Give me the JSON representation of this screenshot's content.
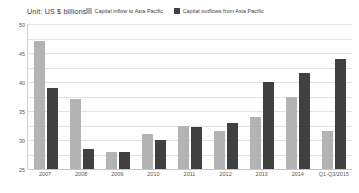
{
  "chart_data": {
    "type": "bar",
    "title": "Unit: US $ billions",
    "xlabel": "",
    "ylabel": "",
    "ylim": [
      0,
      50
    ],
    "yticks": [
      50,
      45,
      40,
      35,
      30,
      25,
      20,
      15,
      10,
      5,
      0
    ],
    "grid": true,
    "legend_position": "top",
    "categories": [
      "2007",
      "2008",
      "2009",
      "2010",
      "2011",
      "2012",
      "2013",
      "2014",
      "Q1-Q3/2015"
    ],
    "series": [
      {
        "name": "Capital inflow to Asia Pacific",
        "color": "#b3b3b3",
        "values": [
          44,
          24,
          6,
          12,
          15,
          13,
          18,
          25,
          13
        ]
      },
      {
        "name": "Capital outflows from Asia Pacific",
        "color": "#404040",
        "values": [
          28,
          7,
          6,
          10,
          14.5,
          16,
          30,
          33,
          38
        ]
      }
    ]
  }
}
